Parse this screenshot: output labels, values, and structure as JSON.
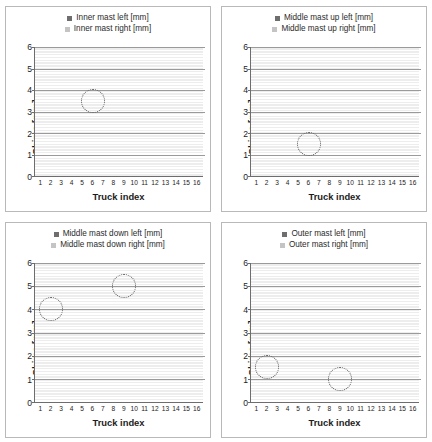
{
  "figure": {
    "panel_count": 4,
    "shared": {
      "xlabel": "Truck index",
      "ylabel": "Shims [mm]",
      "categories": [
        "1",
        "2",
        "3",
        "4",
        "5",
        "6",
        "7",
        "8",
        "9",
        "10",
        "11",
        "12",
        "13",
        "14",
        "15",
        "16"
      ],
      "yticks": [
        "0",
        "1",
        "2",
        "3",
        "4",
        "5",
        "6"
      ],
      "colors": {
        "left_series": "#757575",
        "right_series": "#c9c9c9",
        "grid": "#9a9a9a",
        "axis": "#6d6d6d",
        "highlight": "#5a5a5a"
      }
    }
  },
  "chart_data": [
    {
      "id": "inner-mast",
      "type": "bar",
      "stacked": true,
      "title": "",
      "xlabel": "Truck index",
      "ylabel": "Shims [mm]",
      "ylim": [
        0,
        6
      ],
      "ytick_step": 1,
      "grid": true,
      "legend_position": "top-center",
      "categories": [
        "1",
        "2",
        "3",
        "4",
        "5",
        "6",
        "7",
        "8",
        "9",
        "10",
        "11",
        "12",
        "13",
        "14",
        "15",
        "16"
      ],
      "series": [
        {
          "name": "Inner mast left [mm]",
          "color": "#757575",
          "values": [
            1,
            1,
            1,
            1,
            1,
            1.5,
            0.5,
            0.5,
            1,
            0.5,
            1,
            1,
            1,
            1.5,
            1,
            1.5
          ]
        },
        {
          "name": "Inner mast right [mm]",
          "color": "#c9c9c9",
          "values": [
            1,
            0.5,
            1,
            1,
            1,
            2,
            1,
            0.5,
            1,
            0.5,
            1,
            1,
            1,
            1.5,
            1,
            1
          ]
        }
      ],
      "totals": [
        2,
        1.5,
        2,
        2,
        2,
        3.5,
        1.5,
        1,
        2,
        1,
        2,
        2,
        2,
        3,
        2,
        2.5
      ],
      "annotations": [
        {
          "type": "ellipse-highlight",
          "category": "6",
          "center_value": 3.5
        }
      ]
    },
    {
      "id": "middle-mast-up",
      "type": "bar",
      "stacked": true,
      "title": "",
      "xlabel": "Truck index",
      "ylabel": "Shims [mm]",
      "ylim": [
        0,
        6
      ],
      "ytick_step": 1,
      "grid": true,
      "legend_position": "top-center",
      "categories": [
        "1",
        "2",
        "3",
        "4",
        "5",
        "6",
        "7",
        "8",
        "9",
        "10",
        "11",
        "12",
        "13",
        "14",
        "15",
        "16"
      ],
      "series": [
        {
          "name": "Middle mast up left [mm]",
          "color": "#757575",
          "values": [
            2,
            2.5,
            2.5,
            2,
            2,
            0.5,
            1.5,
            2,
            2.5,
            2,
            2,
            2,
            1,
            2,
            2,
            2
          ]
        },
        {
          "name": "Middle mast up right [mm]",
          "color": "#c9c9c9",
          "values": [
            2,
            2.5,
            2,
            2,
            2,
            1,
            1.5,
            2,
            2,
            2,
            2,
            2,
            1.5,
            1.5,
            2,
            1.5
          ]
        }
      ],
      "totals": [
        4,
        5,
        4.5,
        4,
        4,
        1.5,
        3,
        4,
        4.5,
        4,
        4,
        4,
        2.5,
        3.5,
        4,
        3.5
      ],
      "annotations": [
        {
          "type": "ellipse-highlight",
          "category": "6",
          "center_value": 1.5
        }
      ]
    },
    {
      "id": "middle-mast-down",
      "type": "bar",
      "stacked": true,
      "title": "",
      "xlabel": "Truck index",
      "ylabel": "Shims [mm]",
      "ylim": [
        0,
        6
      ],
      "ytick_step": 1,
      "grid": true,
      "legend_position": "top-center",
      "categories": [
        "1",
        "2",
        "3",
        "4",
        "5",
        "6",
        "7",
        "8",
        "9",
        "10",
        "11",
        "12",
        "13",
        "14",
        "15",
        "16"
      ],
      "series": [
        {
          "name": "Middle mast down left [mm]",
          "color": "#757575",
          "values": [
            0.5,
            2,
            1.5,
            0.5,
            1,
            0.5,
            0.5,
            0.5,
            2.5,
            0.5,
            1,
            0.5,
            1,
            1.5,
            1.5,
            1
          ]
        },
        {
          "name": "Middle mast down right [mm]",
          "color": "#c9c9c9",
          "values": [
            0.5,
            2,
            1,
            0.5,
            0.5,
            0.5,
            1,
            0.5,
            2.5,
            1,
            1,
            1,
            1,
            1,
            1.5,
            1
          ]
        }
      ],
      "totals": [
        1,
        4,
        2.5,
        1,
        1.5,
        1,
        1.5,
        1,
        5,
        1.5,
        2,
        1.5,
        2,
        2.5,
        3,
        2
      ],
      "annotations": [
        {
          "type": "ellipse-highlight",
          "category": "2",
          "center_value": 4
        },
        {
          "type": "ellipse-highlight",
          "category": "9",
          "center_value": 5
        }
      ]
    },
    {
      "id": "outer-mast",
      "type": "bar",
      "stacked": true,
      "title": "",
      "xlabel": "Truck index",
      "ylabel": "Shims [mm]",
      "ylim": [
        0,
        6
      ],
      "ytick_step": 1,
      "grid": true,
      "legend_position": "top-center",
      "categories": [
        "1",
        "2",
        "3",
        "4",
        "5",
        "6",
        "7",
        "8",
        "9",
        "10",
        "11",
        "12",
        "13",
        "14",
        "15",
        "16"
      ],
      "series": [
        {
          "name": "Outer mast left [mm]",
          "color": "#757575",
          "values": [
            2.5,
            1,
            2.5,
            2,
            2.5,
            2,
            2.5,
            2,
            0.5,
            2.5,
            2.5,
            2.5,
            2.5,
            2.5,
            2,
            2
          ]
        },
        {
          "name": "Outer mast right [mm]",
          "color": "#c9c9c9",
          "values": [
            2,
            0.5,
            2.5,
            2.5,
            2,
            2.5,
            2.5,
            2.5,
            4,
            2.5,
            2.5,
            2,
            2.5,
            2,
            2.5,
            1.5
          ]
        }
      ],
      "totals": [
        4.5,
        1.5,
        5,
        4.5,
        4.5,
        4.5,
        5,
        4.5,
        4.5,
        5,
        5,
        4.5,
        5,
        4.5,
        4.5,
        3.5
      ],
      "annotations": [
        {
          "type": "ellipse-highlight",
          "category": "2",
          "center_value": 1.5
        },
        {
          "type": "ellipse-highlight",
          "category": "9",
          "center_value": 1
        }
      ]
    }
  ]
}
